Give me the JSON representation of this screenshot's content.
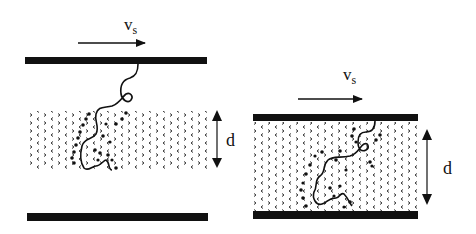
{
  "diagram": {
    "colors": {
      "ink": "#111111",
      "background": "#ffffff",
      "texture": "#333333"
    },
    "left_panel": {
      "velocity_label": "v",
      "velocity_subscript": "s",
      "thickness_label": "d",
      "state": "wide gap: chain partially penetrates layer"
    },
    "right_panel": {
      "velocity_label": "v",
      "velocity_subscript": "s",
      "thickness_label": "d",
      "state": "compressed gap: chain fully within layer"
    }
  }
}
